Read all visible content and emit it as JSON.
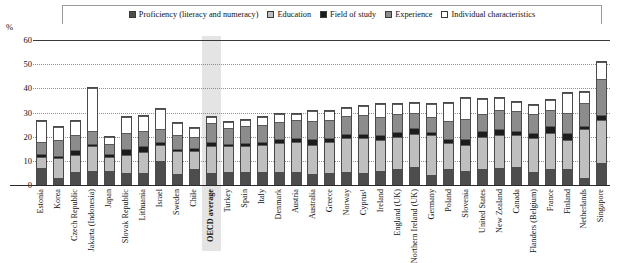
{
  "chart_data": {
    "type": "bar",
    "stacked": true,
    "title": "",
    "xlabel": "",
    "ylabel": "%",
    "ylim": [
      0,
      60
    ],
    "yticks": [
      0,
      10,
      20,
      30,
      40,
      50,
      60
    ],
    "grid": true,
    "legend_position": "top",
    "highlight_category": "OECD average",
    "series": [
      {
        "name": "Proficiency (literacy and numeracy)",
        "color": "#4d4d4d",
        "pattern": "dark-grey",
        "values": [
          7.0,
          3.0,
          5.5,
          6.0,
          6.0,
          5.0,
          5.0,
          10.0,
          4.5,
          6.5,
          5.0,
          5.5,
          5.5,
          5.5,
          5.5,
          5.5,
          4.5,
          5.0,
          5.5,
          5.0,
          6.0,
          6.5,
          7.5,
          4.0,
          6.5,
          6.0,
          6.5,
          7.0,
          7.5,
          5.5,
          6.5,
          6.5,
          3.0,
          9.0
        ]
      },
      {
        "name": "Education",
        "color": "#bfbfbf",
        "pattern": "light-grey",
        "values": [
          4.5,
          8.0,
          7.0,
          10.0,
          5.5,
          7.5,
          8.5,
          6.5,
          9.5,
          7.5,
          11.0,
          10.5,
          10.5,
          11.0,
          12.0,
          12.5,
          12.0,
          13.0,
          14.0,
          14.5,
          12.5,
          13.5,
          13.5,
          16.5,
          11.0,
          10.5,
          13.5,
          13.5,
          13.0,
          14.0,
          15.0,
          12.0,
          20.0,
          18.0
        ]
      },
      {
        "name": "Field of study",
        "color": "#1c1c1c",
        "pattern": "black",
        "values": [
          1.5,
          1.0,
          2.0,
          1.0,
          1.5,
          2.5,
          2.5,
          1.5,
          1.0,
          1.5,
          2.0,
          1.0,
          1.5,
          1.5,
          1.5,
          1.5,
          2.5,
          1.5,
          1.5,
          1.5,
          2.0,
          2.0,
          2.5,
          1.5,
          1.5,
          2.5,
          2.5,
          2.5,
          2.0,
          2.0,
          3.0,
          3.0,
          1.5,
          2.0
        ]
      },
      {
        "name": "Experience",
        "color": "#8c8c8c",
        "pattern": "mid-grey",
        "values": [
          5.0,
          6.5,
          6.0,
          5.5,
          4.0,
          6.5,
          6.5,
          5.0,
          5.5,
          4.5,
          7.5,
          6.5,
          7.0,
          7.0,
          7.0,
          7.5,
          7.5,
          7.5,
          7.5,
          8.0,
          7.5,
          7.5,
          6.5,
          6.0,
          7.5,
          8.5,
          7.0,
          8.0,
          8.0,
          8.0,
          6.5,
          8.5,
          9.5,
          15.0
        ]
      },
      {
        "name": "Individual characteristics",
        "color": "#ffffff",
        "pattern": "white",
        "values": [
          8.5,
          5.5,
          6.0,
          17.5,
          3.0,
          6.5,
          6.0,
          8.5,
          5.0,
          3.5,
          2.5,
          2.5,
          2.5,
          3.0,
          3.5,
          2.5,
          4.0,
          3.5,
          3.5,
          3.5,
          5.5,
          4.0,
          4.0,
          5.5,
          7.5,
          8.5,
          6.0,
          5.0,
          4.0,
          3.5,
          4.0,
          8.0,
          4.5,
          7.0
        ]
      }
    ],
    "categories": [
      "Estonia",
      "Korea",
      "Czech Republic",
      "Jakarta (Indonesia)",
      "Japan",
      "Slovak Republic",
      "Lithuania",
      "Israel",
      "Sweden",
      "Chile",
      "OECD average",
      "Turkey",
      "Spain",
      "Italy",
      "Denmark",
      "Austria",
      "Australia",
      "Greece",
      "Norway",
      "Cyprus¹",
      "Ireland",
      "England (UK)",
      "Northern Ireland (UK)",
      "Germany",
      "Poland",
      "Slovenia",
      "United States",
      "New Zealand",
      "Canada",
      "Flanders (Belgium)",
      "France",
      "Finland",
      "Netherlands",
      "Singapore"
    ],
    "totals": [
      26.5,
      24.0,
      26.5,
      40.0,
      20.0,
      28.0,
      28.5,
      31.5,
      25.5,
      23.5,
      28.0,
      26.0,
      27.0,
      28.0,
      29.5,
      29.5,
      30.5,
      30.5,
      32.0,
      32.5,
      33.5,
      33.5,
      34.0,
      33.5,
      34.0,
      36.0,
      35.5,
      36.0,
      34.5,
      33.0,
      35.0,
      38.0,
      38.5,
      51.0
    ]
  },
  "axis": {
    "unit_label": "%"
  }
}
